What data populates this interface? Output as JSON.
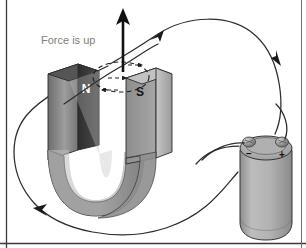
{
  "figure": {
    "background_color": "#ffffff",
    "border_color": "#3a3a3a",
    "width": 306,
    "height": 248
  },
  "annotations": {
    "force_label": {
      "text": "Force is up",
      "color": "#808080",
      "font_size": 11,
      "x": 41,
      "y": 44
    }
  },
  "magnet": {
    "type": "horseshoe-magnet",
    "north_pole": {
      "label": "N",
      "label_color": "#ffffff",
      "face_color": "#3b3b3b",
      "side_color": "#5e5e5e"
    },
    "south_pole": {
      "label": "S",
      "label_color": "#141414",
      "face_color": "#9c9c9c",
      "side_color": "#bdbdbd"
    },
    "body_color": "#8f8f8f",
    "outline_color": "#2b2b2b"
  },
  "battery": {
    "type": "cylindrical-battery",
    "body_color": "#a8a8a8",
    "top_color": "#b5b5b5",
    "outline_color": "#333333",
    "terminals": [
      {
        "name": "negative-terminal",
        "symbol": "−",
        "symbol_color": "#111111"
      },
      {
        "name": "positive-terminal",
        "symbol": "+",
        "symbol_color": "#111111"
      }
    ]
  },
  "circuit": {
    "wire_color": "#2d2d2d",
    "wire_width": 1.2,
    "current_arrow_count": 3,
    "current_arrow_color": "#1a1a1a"
  },
  "force_arrow": {
    "direction": "up",
    "color": "#111111"
  },
  "field_loop": {
    "style": "dashed",
    "color": "#1f1f1f",
    "arrow_count": 3,
    "description": "magnetic field circles around the wire"
  }
}
